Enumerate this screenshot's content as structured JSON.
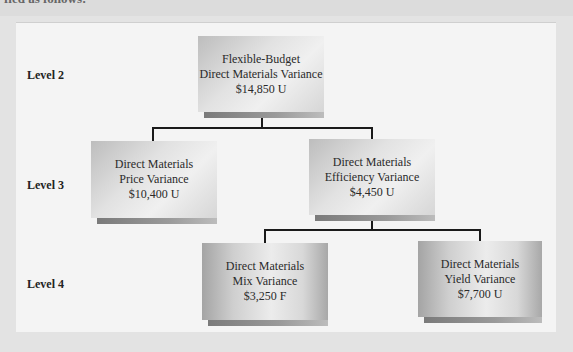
{
  "intro_text": "fied as follows:",
  "levels": [
    {
      "label": "Level 2"
    },
    {
      "label": "Level 3"
    },
    {
      "label": "Level 4"
    }
  ],
  "nodes": {
    "flexible_budget": {
      "line1": "Flexible-Budget",
      "line2": "Direct Materials Variance",
      "amount": "$14,850 U"
    },
    "price": {
      "line1": "Direct Materials",
      "line2": "Price Variance",
      "amount": "$10,400 U"
    },
    "efficiency": {
      "line1": "Direct Materials",
      "line2": "Efficiency Variance",
      "amount": "$4,450 U"
    },
    "mix": {
      "line1": "Direct Materials",
      "line2": "Mix Variance",
      "amount": "$3,250 F"
    },
    "yield": {
      "line1": "Direct Materials",
      "line2": "Yield Variance",
      "amount": "$7,700 U"
    }
  },
  "colors": {
    "panel_background": "#f4f4f4",
    "box_gradient_edge": "#a4a4a4",
    "box_gradient_center": "#ececec",
    "connector": "#1a1a1a",
    "text": "#2a2a2a"
  }
}
